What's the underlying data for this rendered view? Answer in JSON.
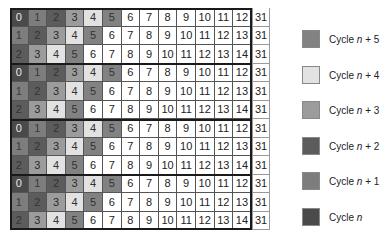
{
  "chart_data": {
    "type": "table",
    "title": "",
    "grid": {
      "columns": 14,
      "rows": 12,
      "row_groups": 4,
      "rows_per_group": 3,
      "group_pattern": [
        [
          "0",
          "1",
          "2",
          "3",
          "4",
          "5",
          "6",
          "7",
          "8",
          "9",
          "10",
          "11",
          "12",
          "31"
        ],
        [
          "1",
          "2",
          "3",
          "4",
          "5",
          "6",
          "7",
          "8",
          "9",
          "10",
          "11",
          "12",
          "13",
          "31"
        ],
        [
          "2",
          "3",
          "4",
          "5",
          "6",
          "7",
          "8",
          "9",
          "10",
          "11",
          "12",
          "13",
          "14",
          "31"
        ]
      ],
      "cells": [
        [
          "0",
          "1",
          "2",
          "3",
          "4",
          "5",
          "6",
          "7",
          "8",
          "9",
          "10",
          "11",
          "12",
          "31"
        ],
        [
          "1",
          "2",
          "3",
          "4",
          "5",
          "6",
          "7",
          "8",
          "9",
          "10",
          "11",
          "12",
          "13",
          "31"
        ],
        [
          "2",
          "3",
          "4",
          "5",
          "6",
          "7",
          "8",
          "9",
          "10",
          "11",
          "12",
          "13",
          "14",
          "31"
        ],
        [
          "0",
          "1",
          "2",
          "3",
          "4",
          "5",
          "6",
          "7",
          "8",
          "9",
          "10",
          "11",
          "12",
          "31"
        ],
        [
          "1",
          "2",
          "3",
          "4",
          "5",
          "6",
          "7",
          "8",
          "9",
          "10",
          "11",
          "12",
          "13",
          "31"
        ],
        [
          "2",
          "3",
          "4",
          "5",
          "6",
          "7",
          "8",
          "9",
          "10",
          "11",
          "12",
          "13",
          "14",
          "31"
        ],
        [
          "0",
          "1",
          "2",
          "3",
          "4",
          "5",
          "6",
          "7",
          "8",
          "9",
          "10",
          "11",
          "12",
          "31"
        ],
        [
          "1",
          "2",
          "3",
          "4",
          "5",
          "6",
          "7",
          "8",
          "9",
          "10",
          "11",
          "12",
          "13",
          "31"
        ],
        [
          "2",
          "3",
          "4",
          "5",
          "6",
          "7",
          "8",
          "9",
          "10",
          "11",
          "12",
          "13",
          "14",
          "31"
        ],
        [
          "0",
          "1",
          "2",
          "3",
          "4",
          "5",
          "6",
          "7",
          "8",
          "9",
          "10",
          "11",
          "12",
          "31"
        ],
        [
          "1",
          "2",
          "3",
          "4",
          "5",
          "6",
          "7",
          "8",
          "9",
          "10",
          "11",
          "12",
          "13",
          "31"
        ],
        [
          "2",
          "3",
          "4",
          "5",
          "6",
          "7",
          "8",
          "9",
          "10",
          "11",
          "12",
          "13",
          "14",
          "31"
        ]
      ],
      "shade_by_value": {
        "0": "cycle n",
        "1": "cycle n+1",
        "2": "cycle n+2",
        "3": "cycle n+3",
        "4": "cycle n+4",
        "5": "cycle n+5"
      }
    },
    "legend": [
      {
        "label_prefix": "Cycle ",
        "label_var": "n",
        "label_suffix": " + 5",
        "color": "#828282"
      },
      {
        "label_prefix": "Cycle ",
        "label_var": "n",
        "label_suffix": " + 4",
        "color": "#e2e2e2"
      },
      {
        "label_prefix": "Cycle ",
        "label_var": "n",
        "label_suffix": " + 3",
        "color": "#9c9c9c"
      },
      {
        "label_prefix": "Cycle ",
        "label_var": "n",
        "label_suffix": " + 2",
        "color": "#5c5c5c"
      },
      {
        "label_prefix": "Cycle ",
        "label_var": "n",
        "label_suffix": " + 1",
        "color": "#7d7d7d"
      },
      {
        "label_prefix": "Cycle ",
        "label_var": "n",
        "label_suffix": "",
        "color": "#4a4a4a"
      }
    ],
    "legend_position": "right"
  }
}
